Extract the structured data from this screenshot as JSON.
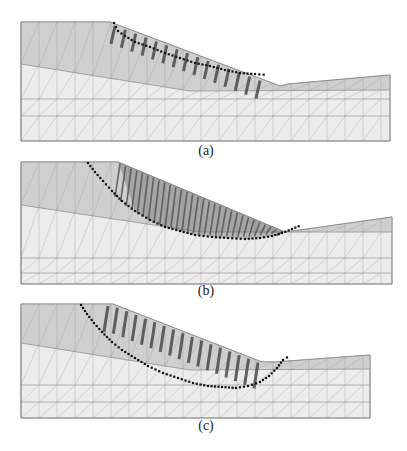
{
  "figure": {
    "panels": [
      {
        "label": "(a)",
        "label_pos": [
          206,
          152
        ],
        "box": {
          "left": 21,
          "right": 390,
          "top": 22,
          "bottom": 141
        },
        "surface": [
          [
            21,
            22
          ],
          [
            110,
            22
          ],
          [
            280,
            86
          ],
          [
            288,
            84
          ],
          [
            390,
            75
          ]
        ],
        "layer_boundary": [
          [
            21,
            64
          ],
          [
            190,
            91
          ],
          [
            390,
            90
          ]
        ],
        "mesh_lines_h": [
          99,
          116
        ],
        "slip_dots": [
          [
            114,
            23
          ],
          [
            118,
            31
          ],
          [
            125,
            36
          ],
          [
            135,
            42
          ],
          [
            150,
            47
          ],
          [
            165,
            53
          ],
          [
            180,
            58
          ],
          [
            195,
            63
          ],
          [
            210,
            66
          ],
          [
            225,
            70
          ],
          [
            240,
            73
          ],
          [
            255,
            74
          ],
          [
            268,
            75
          ]
        ],
        "slices": {
          "x0": 115,
          "x1": 260,
          "count": 15,
          "len": 18
        }
      },
      {
        "label": "(b)",
        "label_pos": [
          206,
          292
        ],
        "box": {
          "left": 21,
          "right": 392,
          "top": 162,
          "bottom": 284
        },
        "surface": [
          [
            21,
            162
          ],
          [
            118,
            162
          ],
          [
            285,
            232
          ],
          [
            300,
            230
          ],
          [
            392,
            217
          ]
        ],
        "layer_boundary": [
          [
            21,
            205
          ],
          [
            200,
            232
          ],
          [
            392,
            232
          ]
        ],
        "mesh_lines_h": [
          258,
          273
        ],
        "slip_dots": [
          [
            88,
            163
          ],
          [
            95,
            172
          ],
          [
            103,
            181
          ],
          [
            112,
            191
          ],
          [
            122,
            201
          ],
          [
            135,
            211
          ],
          [
            150,
            220
          ],
          [
            165,
            227
          ],
          [
            180,
            231
          ],
          [
            195,
            235
          ],
          [
            212,
            237
          ],
          [
            228,
            238
          ],
          [
            245,
            239
          ],
          [
            260,
            238
          ],
          [
            272,
            236
          ],
          [
            282,
            233
          ],
          [
            292,
            229
          ],
          [
            302,
            225
          ]
        ],
        "fan": {
          "x0": 120,
          "x1": 282,
          "count": 30
        }
      },
      {
        "label": "(c)",
        "label_pos": [
          206,
          427
        ],
        "box": {
          "left": 21,
          "right": 370,
          "top": 304,
          "bottom": 418
        },
        "surface": [
          [
            21,
            304
          ],
          [
            113,
            304
          ],
          [
            262,
            362
          ],
          [
            275,
            362
          ],
          [
            370,
            355
          ]
        ],
        "layer_boundary": [
          [
            21,
            343
          ],
          [
            190,
            370
          ],
          [
            370,
            369
          ]
        ],
        "mesh_lines_h": [
          385,
          402
        ],
        "slip_dots": [
          [
            81,
            305
          ],
          [
            87,
            314
          ],
          [
            94,
            323
          ],
          [
            102,
            332
          ],
          [
            112,
            342
          ],
          [
            122,
            350
          ],
          [
            135,
            358
          ],
          [
            148,
            366
          ],
          [
            163,
            373
          ],
          [
            178,
            378
          ],
          [
            193,
            383
          ],
          [
            208,
            386
          ],
          [
            222,
            387
          ],
          [
            236,
            388
          ],
          [
            248,
            386
          ],
          [
            260,
            382
          ],
          [
            269,
            376
          ],
          [
            277,
            368
          ],
          [
            283,
            360
          ],
          [
            291,
            355
          ]
        ],
        "slices": {
          "x0": 108,
          "x1": 258,
          "count": 17,
          "len": 26
        }
      }
    ]
  },
  "colors": {
    "upper_layer": "#cfcfcf",
    "lower_layer": "#ececec",
    "mesh": "#9a9a9a",
    "slice": "#4a4a4a",
    "dots": "#111111"
  }
}
